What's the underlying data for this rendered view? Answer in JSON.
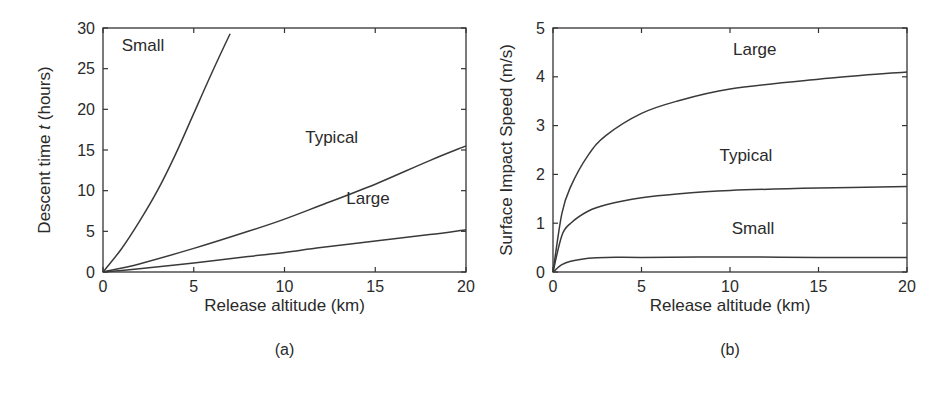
{
  "chart_data": [
    {
      "panel": "(a)",
      "type": "line",
      "title": "",
      "xlabel": "Release altitude (km)",
      "ylabel": "Descent time t (hours)",
      "xlim": [
        0,
        20
      ],
      "ylim": [
        0,
        30
      ],
      "xticks": [
        0,
        5,
        10,
        15,
        20
      ],
      "yticks": [
        0,
        5,
        10,
        15,
        20,
        25,
        30
      ],
      "grid": false,
      "legend": "inline labels",
      "series": [
        {
          "name": "Small",
          "x": [
            0,
            1,
            2,
            3,
            4,
            5,
            6,
            7
          ],
          "y": [
            0,
            2.8,
            6.2,
            10.0,
            14.5,
            19.5,
            24.5,
            29.3
          ]
        },
        {
          "name": "Typical",
          "x": [
            0,
            2,
            5,
            8,
            10,
            12,
            15,
            18,
            20
          ],
          "y": [
            0,
            1.0,
            2.9,
            5.0,
            6.5,
            8.2,
            10.8,
            13.7,
            15.5
          ]
        },
        {
          "name": "Large",
          "x": [
            0,
            2,
            5,
            8,
            10,
            12,
            15,
            18,
            20
          ],
          "y": [
            0,
            0.4,
            1.1,
            1.9,
            2.4,
            3.0,
            3.8,
            4.6,
            5.2
          ]
        }
      ],
      "annotations": [
        {
          "text": "Small",
          "x": 2.2,
          "y": 27.2
        },
        {
          "text": "Typical",
          "x": 12.6,
          "y": 15.8
        },
        {
          "text": "Large",
          "x": 14.6,
          "y": 8.3
        }
      ]
    },
    {
      "panel": "(b)",
      "type": "line",
      "title": "",
      "xlabel": "Release altitude (km)",
      "ylabel": "Surface Impact Speed (m/s)",
      "xlim": [
        0,
        20
      ],
      "ylim": [
        0,
        5
      ],
      "xticks": [
        0,
        5,
        10,
        15,
        20
      ],
      "yticks": [
        0,
        1,
        2,
        3,
        4,
        5
      ],
      "grid": false,
      "legend": "inline labels",
      "series": [
        {
          "name": "Large",
          "x": [
            0,
            0.5,
            1,
            2,
            3,
            5,
            7,
            10,
            15,
            20
          ],
          "y": [
            0,
            1.2,
            1.75,
            2.4,
            2.8,
            3.25,
            3.5,
            3.75,
            3.95,
            4.1
          ]
        },
        {
          "name": "Typical",
          "x": [
            0,
            0.5,
            1,
            2,
            3,
            5,
            7,
            10,
            15,
            20
          ],
          "y": [
            0,
            0.75,
            1.0,
            1.25,
            1.38,
            1.52,
            1.6,
            1.67,
            1.72,
            1.75
          ]
        },
        {
          "name": "Small",
          "x": [
            0,
            0.5,
            1,
            2,
            3,
            5,
            10,
            15,
            20
          ],
          "y": [
            0,
            0.15,
            0.22,
            0.28,
            0.3,
            0.3,
            0.31,
            0.3,
            0.3
          ]
        }
      ],
      "annotations": [
        {
          "text": "Large",
          "x": 11.4,
          "y": 4.45
        },
        {
          "text": "Typical",
          "x": 10.9,
          "y": 2.28
        },
        {
          "text": "Small",
          "x": 11.3,
          "y": 0.78
        }
      ]
    }
  ],
  "panels": {
    "a": {
      "label": "(a)",
      "xlabel": "Release altitude (km)",
      "ylabel_pre": "Descent time ",
      "ylabel_var": "t",
      "ylabel_post": " (hours)"
    },
    "b": {
      "label": "(b)",
      "xlabel": "Release altitude (km)",
      "ylabel": "Surface Impact Speed (m/s)"
    }
  }
}
